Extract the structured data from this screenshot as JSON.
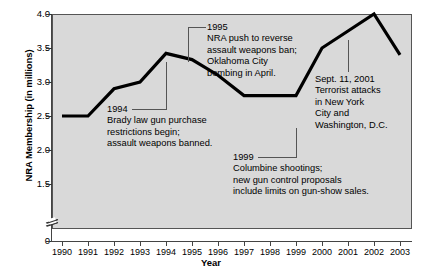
{
  "chart_data": {
    "type": "line",
    "title": "",
    "xlabel": "Year",
    "ylabel": "NRA Membership (in millions)",
    "categories": [
      1990,
      1991,
      1992,
      1993,
      1994,
      1995,
      1996,
      1997,
      1998,
      1999,
      2000,
      2001,
      2002,
      2003
    ],
    "values": [
      2.5,
      2.5,
      2.9,
      3.0,
      3.42,
      3.33,
      3.1,
      2.8,
      2.8,
      2.8,
      3.5,
      3.75,
      4.0,
      3.4
    ],
    "x_tick_labels": [
      "1990",
      "1991",
      "1992",
      "1993",
      "1994",
      "1995",
      "1996",
      "1997",
      "1998",
      "1999",
      "2000",
      "2001",
      "2002",
      "2003"
    ],
    "y_tick_labels": [
      "4.0",
      "3.5",
      "3.0",
      "2.5",
      "2.0",
      "1.5",
      "0"
    ],
    "y_tick_values": [
      4.0,
      3.5,
      3.0,
      2.5,
      2.0,
      1.5,
      0
    ],
    "ylim": [
      1.35,
      4.0
    ],
    "axis_break": true,
    "grid": false,
    "legend": "none",
    "plot_background": "#d9d9d9",
    "line_color": "#000000",
    "annotations": [
      {
        "id": "ann-1994",
        "year_label": "1994",
        "lines": [
          "Brady law gun purchase",
          "restrictions begin;",
          "assault weapons banned."
        ]
      },
      {
        "id": "ann-1995",
        "year_label": "1995",
        "lines": [
          "NRA push to reverse",
          "assault weapons ban;",
          "Oklahoma City",
          "bombing in April."
        ]
      },
      {
        "id": "ann-1999",
        "year_label": "1999",
        "lines": [
          "Columbine shootings;",
          "new gun control proposals",
          "include limits on gun-show sales."
        ]
      },
      {
        "id": "ann-2001",
        "year_label": "Sept. 11, 2001",
        "lines": [
          "Terrorist attacks",
          "in New York",
          "City and",
          "Washington, D.C."
        ]
      }
    ]
  },
  "axes": {
    "y_title": "NRA Membership (in millions)",
    "x_title": "Year",
    "y_labels": {
      "t0": "4.0",
      "t1": "3.5",
      "t2": "3.0",
      "t3": "2.5",
      "t4": "2.0",
      "t5": "1.5",
      "t6": "0"
    },
    "x_labels": {
      "y0": "1990",
      "y1": "1991",
      "y2": "1992",
      "y3": "1993",
      "y4": "1994",
      "y5": "1995",
      "y6": "1996",
      "y7": "1997",
      "y8": "1998",
      "y9": "1999",
      "y10": "2000",
      "y11": "2001",
      "y12": "2002",
      "y13": "2003"
    }
  },
  "annotations": {
    "a1994": {
      "year": "1994",
      "l1": "Brady law gun purchase",
      "l2": "restrictions begin;",
      "l3": "assault weapons banned."
    },
    "a1995": {
      "year": "1995",
      "l1": "NRA push to reverse",
      "l2": "assault weapons ban;",
      "l3": "Oklahoma City",
      "l4": "bombing in April."
    },
    "a1999": {
      "year": "1999",
      "l1": "Columbine shootings;",
      "l2": "new gun control proposals",
      "l3": "include limits on gun-show sales."
    },
    "a2001": {
      "year": "Sept. 11, 2001",
      "l1": "Terrorist attacks",
      "l2": "in New York",
      "l3": "City and",
      "l4": "Washington, D.C."
    }
  }
}
